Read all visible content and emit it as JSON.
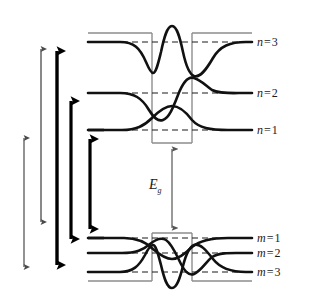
{
  "figure": {
    "colors": {
      "curve": "#111111",
      "barrier": "#8d8d8d",
      "dashed_level": "#1a1a1a",
      "thin_arrow": "#4a4a4a",
      "thick_arrow": "#000000",
      "background": "#ffffff"
    }
  },
  "band_gap": {
    "label_base": "E",
    "label_sub": "g",
    "arrow_top_y": 143,
    "arrow_bottom_y": 233,
    "arrow_x": 172
  },
  "conduction_levels": [
    {
      "id": "n3",
      "label_base": "n",
      "eq": "=",
      "value": "3",
      "y": 42,
      "label_x": 257,
      "label_y": 36
    },
    {
      "id": "n2",
      "label_base": "n",
      "eq": "=",
      "value": "2",
      "y": 93,
      "label_x": 257,
      "label_y": 87
    },
    {
      "id": "n1",
      "label_base": "n",
      "eq": "=",
      "value": "1",
      "y": 130,
      "label_x": 257,
      "label_y": 124
    }
  ],
  "valence_levels": [
    {
      "id": "m1",
      "label_base": "m",
      "eq": "=",
      "value": "1",
      "y": 238,
      "label_x": 257,
      "label_y": 232
    },
    {
      "id": "m2",
      "label_base": "m",
      "eq": "=",
      "value": "2",
      "y": 253,
      "label_x": 257,
      "label_y": 247
    },
    {
      "id": "m3",
      "label_base": "m",
      "eq": "=",
      "value": "3",
      "y": 272,
      "label_x": 257,
      "label_y": 266
    }
  ],
  "wells": {
    "upper": {
      "left_x": 152,
      "right_x": 192,
      "top_y": 33,
      "bottom_y": 143
    },
    "lower": {
      "left_x": 152,
      "right_x": 192,
      "top_y": 233,
      "bottom_y": 281
    }
  },
  "transition_arrows": [
    {
      "id": "arrow-1",
      "style": "thin",
      "x": 24,
      "y_top": 132,
      "y_bottom": 273
    },
    {
      "id": "arrow-2",
      "style": "thin",
      "x": 41,
      "y_top": 43,
      "y_bottom": 228
    },
    {
      "id": "arrow-3",
      "style": "thick",
      "x": 57,
      "y_top": 42,
      "y_bottom": 274
    },
    {
      "id": "arrow-4",
      "style": "thick",
      "x": 71,
      "y_top": 92,
      "y_bottom": 248
    },
    {
      "id": "arrow-5",
      "style": "thick",
      "x": 90,
      "y_top": 130,
      "y_bottom": 238
    }
  ]
}
